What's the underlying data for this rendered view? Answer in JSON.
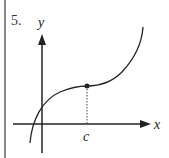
{
  "problem": {
    "number": "5."
  },
  "diagram": {
    "axes": {
      "x_label": "x",
      "y_label": "y"
    },
    "marked_point": {
      "label": "c",
      "description": "inflection point with horizontal tangent, dotted drop line to x-axis"
    },
    "curve": {
      "description": "cubic-like increasing curve, concave down then concave up"
    },
    "colors": {
      "stroke": "#222222",
      "border": "#8a8a8a"
    }
  }
}
